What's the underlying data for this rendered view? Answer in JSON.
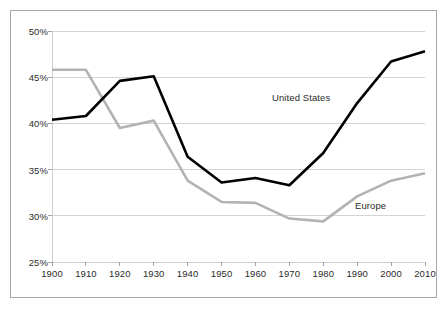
{
  "figure": {
    "name": "labor-share-line-chart",
    "background_color": "#ffffff",
    "border_color": "#a8a8a8"
  },
  "chart_data": {
    "type": "line",
    "title": "",
    "subtitle": "",
    "xlabel": "",
    "ylabel": "",
    "x": [
      1900,
      1910,
      1920,
      1930,
      1940,
      1950,
      1960,
      1970,
      1980,
      1990,
      2000,
      2010
    ],
    "categories": [
      "1900",
      "1910",
      "1920",
      "1930",
      "1940",
      "1950",
      "1960",
      "1970",
      "1980",
      "1990",
      "2000",
      "2010"
    ],
    "xlim": [
      1900,
      2010
    ],
    "ylim": [
      25,
      50
    ],
    "ytick_values": [
      50,
      45,
      40,
      35,
      30,
      25
    ],
    "ytick_labels": [
      "50%",
      "45%",
      "40%",
      "35%",
      "30%",
      "25%"
    ],
    "xtick_labels": [
      "1900",
      "1910",
      "1920",
      "1930",
      "1940",
      "1950",
      "1960",
      "1970",
      "1980",
      "1990",
      "2000",
      "2010"
    ],
    "grid": "horizontal",
    "grid_color": "#c9c9c9",
    "legend_position": "inline-annotation",
    "series": [
      {
        "name": "United States",
        "color": "#000000",
        "line_width": 2.6,
        "label_text": "United States",
        "values": [
          40.4,
          40.8,
          44.6,
          45.1,
          36.4,
          33.6,
          34.1,
          33.3,
          36.8,
          42.2,
          46.7,
          47.8
        ]
      },
      {
        "name": "Europe",
        "color": "#b3b3b3",
        "line_width": 2.6,
        "label_text": "Europe",
        "values": [
          45.8,
          45.8,
          39.5,
          40.3,
          33.8,
          31.5,
          31.4,
          29.7,
          29.4,
          32.1,
          33.8,
          34.6
        ]
      }
    ]
  }
}
